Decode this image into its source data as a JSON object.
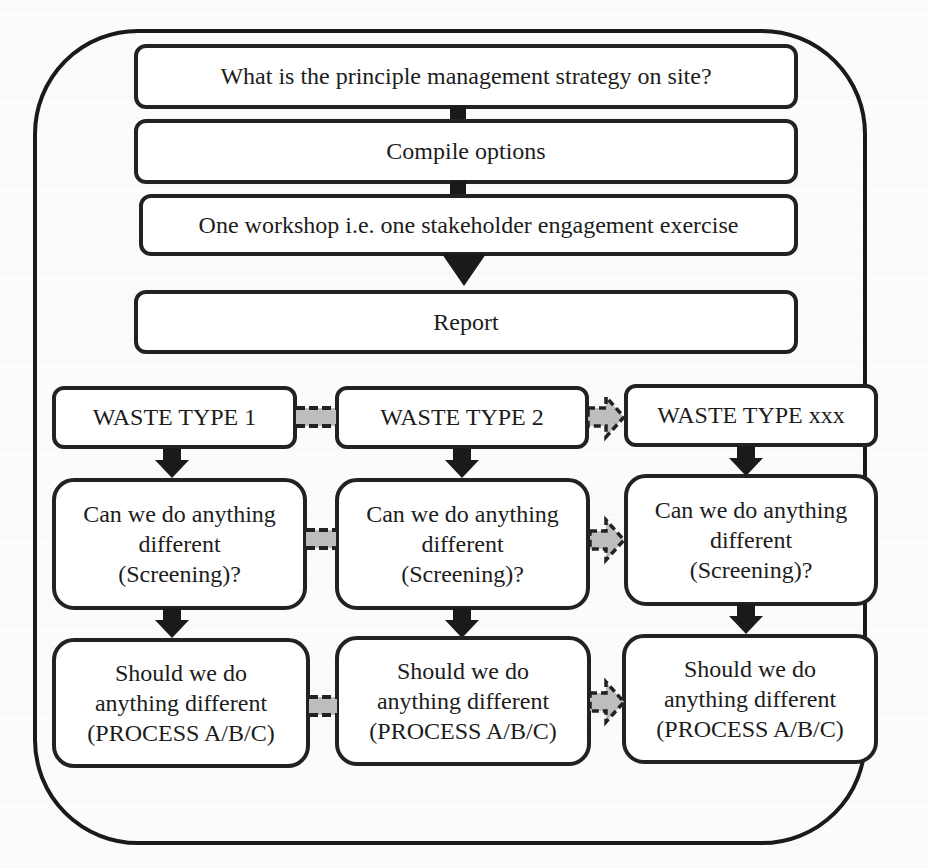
{
  "diagram": {
    "type": "flowchart",
    "top_steps": [
      {
        "id": "strategy",
        "label": "What is the principle management strategy on site?"
      },
      {
        "id": "compile",
        "label": "Compile options"
      },
      {
        "id": "workshop",
        "label": "One workshop i.e. one stakeholder engagement exercise"
      },
      {
        "id": "report",
        "label": "Report"
      }
    ],
    "columns": [
      {
        "header": "WASTE TYPE 1",
        "screening": [
          "Can we do anything",
          "different",
          "(Screening)?"
        ],
        "process": [
          "Should we do",
          "anything different",
          "(PROCESS A/B/C)"
        ]
      },
      {
        "header": "WASTE TYPE 2",
        "screening": [
          "Can we do anything",
          "different",
          "(Screening)?"
        ],
        "process": [
          "Should we do",
          "anything different",
          "(PROCESS A/B/C)"
        ]
      },
      {
        "header": "WASTE TYPE xxx",
        "screening": [
          "Can we do anything",
          "different",
          "(Screening)?"
        ],
        "process": [
          "Should we do",
          "anything different",
          "(PROCESS A/B/C)"
        ]
      }
    ],
    "connectors": {
      "vertical": "solid black down arrows",
      "horizontal": "gray dashed block arrows between columns"
    },
    "colors": {
      "stroke": "#1a1a1a",
      "box_fill": "#ffffff",
      "connector_fill": "#bdbdbd",
      "background": "#fbfbfb"
    }
  }
}
